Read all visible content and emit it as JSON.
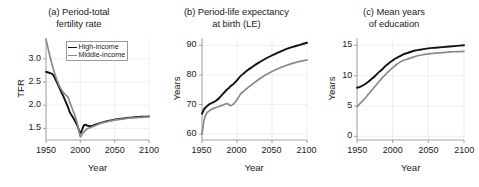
{
  "figure": {
    "width": 473,
    "height": 187,
    "background": "#ffffff"
  },
  "colors": {
    "high_income": "#111111",
    "middle_income": "#8a8a8a",
    "axis": "#9a9a9a",
    "grid": "#e8e8e8",
    "text": "#1a1a1a",
    "legend_border": "#9a9a9a"
  },
  "legend": {
    "position": "top-right-panel-a",
    "entries": [
      {
        "label": "High-income",
        "color": "#111111"
      },
      {
        "label": "Middle-income",
        "color": "#8a8a8a"
      }
    ]
  },
  "panels": {
    "a": {
      "title_line1": "(a) Period-total",
      "title_line2": "fertility rate",
      "ylabel": "TFR",
      "xlabel": "Year",
      "yticks": [
        "1.5",
        "2.0",
        "2.5",
        "3.0"
      ],
      "xticks": [
        "1950",
        "2000",
        "2050",
        "2100"
      ]
    },
    "b": {
      "title_line1": "(b) Period-life expectancy",
      "title_line2": "at birth (LE)",
      "ylabel": "Years",
      "xlabel": "Year",
      "yticks": [
        "60",
        "70",
        "80",
        "90"
      ],
      "xticks": [
        "1950",
        "2000",
        "2050",
        "2100"
      ]
    },
    "c": {
      "title_line1": "(c) Mean years",
      "title_line2": "of education",
      "ylabel": "Years",
      "xlabel": "Year",
      "yticks": [
        "0",
        "5",
        "10",
        "15"
      ],
      "xticks": [
        "1950",
        "2000",
        "2050",
        "2100"
      ]
    }
  },
  "chart_data": [
    {
      "id": "panel-a",
      "type": "line",
      "title": "(a) Period-total fertility rate",
      "xlabel": "Year",
      "ylabel": "TFR",
      "xlim": [
        1950,
        2100
      ],
      "ylim": [
        1.25,
        3.45
      ],
      "xticks": [
        1950,
        2000,
        2050,
        2100
      ],
      "yticks": [
        1.5,
        2.0,
        2.5,
        3.0
      ],
      "grid": true,
      "legend": "inside top-right",
      "x": [
        1950,
        1955,
        1960,
        1965,
        1970,
        1975,
        1980,
        1982,
        1985,
        1990,
        1995,
        1998,
        2000,
        2002,
        2005,
        2008,
        2010,
        2015,
        2020,
        2030,
        2040,
        2050,
        2060,
        2070,
        2080,
        2090,
        2100
      ],
      "series": [
        {
          "name": "High-income",
          "color": "#111111",
          "values": [
            2.72,
            2.7,
            2.66,
            2.52,
            2.36,
            2.2,
            2.03,
            1.96,
            1.84,
            1.72,
            1.58,
            1.46,
            1.4,
            1.45,
            1.56,
            1.58,
            1.56,
            1.55,
            1.57,
            1.62,
            1.66,
            1.69,
            1.71,
            1.73,
            1.74,
            1.75,
            1.76
          ]
        },
        {
          "name": "Middle-income",
          "color": "#8a8a8a",
          "values": [
            3.42,
            3.1,
            2.82,
            2.58,
            2.4,
            2.28,
            2.2,
            2.18,
            2.05,
            1.86,
            1.64,
            1.44,
            1.32,
            1.36,
            1.42,
            1.47,
            1.49,
            1.52,
            1.55,
            1.61,
            1.65,
            1.68,
            1.7,
            1.72,
            1.73,
            1.74,
            1.75
          ]
        }
      ]
    },
    {
      "id": "panel-b",
      "type": "line",
      "title": "(b) Period-life expectancy at birth (LE)",
      "xlabel": "Year",
      "ylabel": "Years",
      "xlim": [
        1950,
        2100
      ],
      "ylim": [
        58,
        92.5
      ],
      "xticks": [
        1950,
        2000,
        2050,
        2100
      ],
      "yticks": [
        60,
        70,
        80,
        90
      ],
      "grid": true,
      "legend": "none",
      "x": [
        1950,
        1953,
        1956,
        1960,
        1965,
        1970,
        1975,
        1980,
        1985,
        1988,
        1990,
        1993,
        1995,
        2000,
        2005,
        2010,
        2015,
        2020,
        2030,
        2040,
        2050,
        2060,
        2070,
        2080,
        2090,
        2100
      ],
      "series": [
        {
          "name": "High-income",
          "color": "#111111",
          "values": [
            66.9,
            68.4,
            69.2,
            70.0,
            70.6,
            71.3,
            72.3,
            73.6,
            74.9,
            75.5,
            76.0,
            76.6,
            77.0,
            78.2,
            79.6,
            80.6,
            81.6,
            82.4,
            84.0,
            85.4,
            86.6,
            87.7,
            88.7,
            89.5,
            90.2,
            90.9
          ]
        },
        {
          "name": "Middle-income",
          "color": "#8a8a8a",
          "values": [
            60.0,
            64.8,
            66.8,
            67.8,
            68.6,
            69.0,
            69.4,
            69.8,
            70.3,
            70.1,
            69.6,
            69.8,
            70.2,
            71.6,
            73.5,
            74.6,
            75.6,
            76.5,
            78.3,
            79.9,
            81.2,
            82.3,
            83.2,
            84.0,
            84.6,
            85.1
          ]
        }
      ]
    },
    {
      "id": "panel-c",
      "type": "line",
      "title": "(c) Mean years of education",
      "xlabel": "Year",
      "ylabel": "Years",
      "xlim": [
        1950,
        2100
      ],
      "ylim": [
        -0.6,
        16.2
      ],
      "xticks": [
        1950,
        2000,
        2050,
        2100
      ],
      "yticks": [
        0,
        5,
        10,
        15
      ],
      "grid": true,
      "legend": "none",
      "x": [
        1950,
        1955,
        1960,
        1965,
        1970,
        1975,
        1980,
        1985,
        1990,
        1995,
        2000,
        2005,
        2010,
        2015,
        2020,
        2030,
        2040,
        2050,
        2060,
        2070,
        2080,
        2090,
        2100
      ],
      "series": [
        {
          "name": "High-income",
          "color": "#111111",
          "values": [
            8.0,
            8.2,
            8.5,
            8.9,
            9.4,
            9.9,
            10.5,
            11.0,
            11.6,
            12.1,
            12.5,
            12.9,
            13.2,
            13.5,
            13.7,
            14.1,
            14.3,
            14.5,
            14.6,
            14.7,
            14.8,
            14.9,
            15.0
          ]
        },
        {
          "name": "Middle-income",
          "color": "#8a8a8a",
          "values": [
            4.9,
            5.5,
            6.1,
            6.8,
            7.5,
            8.2,
            8.9,
            9.6,
            10.2,
            10.8,
            11.3,
            11.8,
            12.2,
            12.5,
            12.7,
            13.1,
            13.4,
            13.6,
            13.7,
            13.8,
            13.9,
            13.95,
            14.0
          ]
        }
      ]
    }
  ]
}
